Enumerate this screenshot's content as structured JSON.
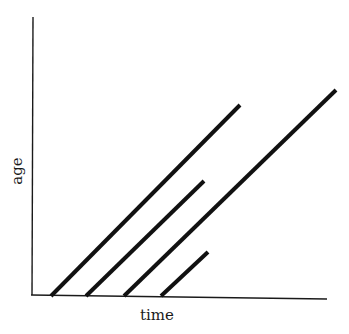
{
  "chart_data": {
    "type": "line",
    "title": "",
    "xlabel": "time",
    "ylabel": "age",
    "grid": false,
    "legend": null,
    "axis_pixels": {
      "y_axis": {
        "x1": 33,
        "y1": 17,
        "x2": 32,
        "y2": 295
      },
      "x_axis": {
        "x1": 31,
        "y1": 295,
        "x2": 327,
        "y2": 299
      }
    },
    "series": [
      {
        "name": "lifeline-1",
        "points": [
          [
            51,
            296
          ],
          [
            240,
            105
          ]
        ]
      },
      {
        "name": "lifeline-2",
        "points": [
          [
            86,
            296
          ],
          [
            204,
            181
          ]
        ]
      },
      {
        "name": "lifeline-3",
        "points": [
          [
            124,
            296
          ],
          [
            336,
            90
          ]
        ]
      },
      {
        "name": "lifeline-4",
        "points": [
          [
            161,
            296
          ],
          [
            208,
            252
          ]
        ]
      }
    ],
    "colors": {
      "line": "#111111",
      "axis": "#1a1a1a",
      "background": "#ffffff"
    }
  }
}
